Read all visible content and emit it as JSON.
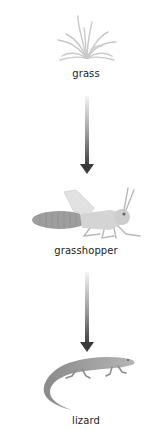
{
  "diagram": {
    "type": "food-chain",
    "nodes": [
      {
        "id": "grass",
        "label": "grass",
        "icon": "grass-icon"
      },
      {
        "id": "grasshopper",
        "label": "grasshopper",
        "icon": "grasshopper-icon"
      },
      {
        "id": "lizard",
        "label": "lizard",
        "icon": "lizard-icon"
      }
    ],
    "edges": [
      {
        "from": "grass",
        "to": "grasshopper"
      },
      {
        "from": "grasshopper",
        "to": "lizard"
      }
    ],
    "colors": {
      "arrow": "#3a3a3a",
      "illustration": "#b8b8b8",
      "label": "#222222"
    }
  }
}
